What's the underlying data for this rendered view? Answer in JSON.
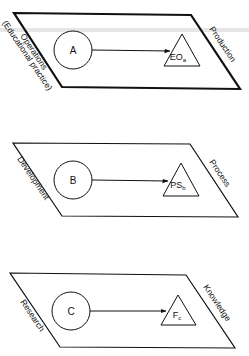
{
  "diagram": {
    "stroke_color": "#111111",
    "background": "#ffffff",
    "planes": [
      {
        "id": "top",
        "left_label": "Operations",
        "left_sublabel": "(Educational practice)",
        "right_label": "Production",
        "circle_label": "A",
        "triangle_label": "EO",
        "triangle_sub": "a"
      },
      {
        "id": "middle",
        "left_label": "Development",
        "right_label": "Process",
        "circle_label": "B",
        "triangle_label": "PS",
        "triangle_sub": "b"
      },
      {
        "id": "bottom",
        "left_label": "Research",
        "right_label": "Knowledge",
        "circle_label": "C",
        "triangle_label": "F",
        "triangle_sub": "c"
      }
    ]
  }
}
